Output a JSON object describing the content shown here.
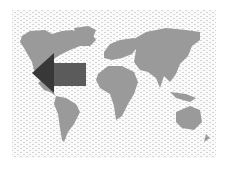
{
  "figure": {
    "type": "world-map-illustration",
    "background": "wavy-pattern",
    "colors": {
      "land": "#9a9a9a",
      "pattern": "#d4d4d4",
      "arrow_head": "#383838",
      "arrow_body": "#4e4e4e"
    },
    "arrow": {
      "direction": "left",
      "points_to": "west-coast-north-america"
    }
  }
}
